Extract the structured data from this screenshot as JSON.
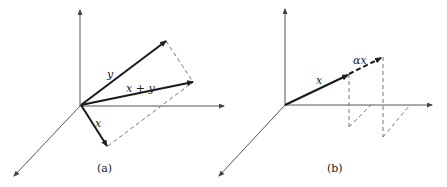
{
  "panels": [
    {
      "id": "a",
      "caption": "(a)",
      "vectors": [
        {
          "name": "y",
          "label": "y"
        },
        {
          "name": "x_plus_y",
          "label": "x + y"
        },
        {
          "name": "x",
          "label": "x"
        }
      ]
    },
    {
      "id": "b",
      "caption": "(b)",
      "vectors": [
        {
          "name": "x",
          "label": "x"
        },
        {
          "name": "alpha_x",
          "label": "αx"
        }
      ]
    }
  ],
  "colors": {
    "axis": "#555555",
    "vector": "#1a1a1a",
    "dashed": "#777777"
  }
}
